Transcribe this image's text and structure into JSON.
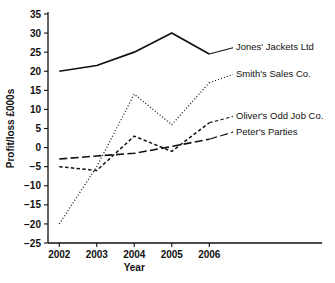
{
  "chart_data": {
    "type": "line",
    "title": "",
    "xlabel": "Year",
    "ylabel": "Profit/loss £000s",
    "categories": [
      "2002",
      "2003",
      "2004",
      "2005",
      "2006"
    ],
    "x": [
      2002,
      2003,
      2004,
      2005,
      2006
    ],
    "xlim": [
      2001.7,
      2006.5
    ],
    "ylim": [
      -25,
      35
    ],
    "ytick_step": 5,
    "yticks": [
      35,
      30,
      25,
      20,
      15,
      10,
      5,
      0,
      -5,
      -10,
      -15,
      -20,
      -25
    ],
    "ytick_labels": [
      "35",
      "30",
      "25",
      "20",
      "15",
      "10",
      "5",
      "0",
      "−5",
      "−10",
      "−15",
      "−20",
      "−25"
    ],
    "grid": false,
    "legend_position": "inline-right",
    "series": [
      {
        "name": "Jones' Jackets Ltd",
        "style": "solid",
        "values": [
          20,
          21.5,
          25,
          30,
          24.5
        ],
        "label_y": 25.5
      },
      {
        "name": "Smith's Sales Co.",
        "style": "dotted",
        "values": [
          -20,
          -5,
          14,
          6,
          17
        ],
        "label_y": 18.5
      },
      {
        "name": "Oliver's Odd Job Co.",
        "style": "dashed-short",
        "values": [
          -5,
          -6,
          3,
          -1,
          6.5
        ],
        "label_y": 7.5
      },
      {
        "name": "Peter's Parties",
        "style": "dashed-long",
        "values": [
          -3,
          -2.2,
          -1.5,
          0.3,
          2.2
        ],
        "label_y": 3.4
      }
    ]
  }
}
